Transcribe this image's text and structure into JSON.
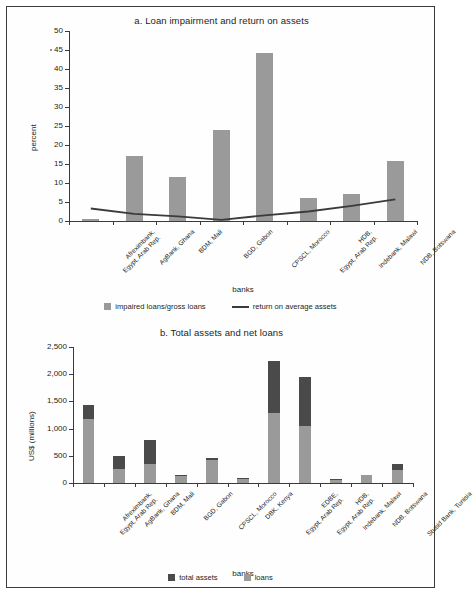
{
  "figure": {
    "border_color": "#3b3b3b",
    "background": "#ffffff"
  },
  "chart_data": [
    {
      "id": "panel-a",
      "type": "bar",
      "title": "a.  Loan impairment and return on assets",
      "xlabel": "banks",
      "ylabel": "percent",
      "ylim": [
        0,
        50
      ],
      "yticks": [
        0,
        5,
        10,
        15,
        20,
        25,
        30,
        35,
        40,
        45,
        50
      ],
      "ytick_labels": [
        "0",
        "5",
        "10",
        "15",
        "20",
        "25",
        "30",
        "35",
        "40",
        "45",
        "50"
      ],
      "grid": false,
      "legend_position": "bottom",
      "categories": [
        [
          "Afreximbank,",
          "Egypt, Arab Rep."
        ],
        [
          "AgBank, Ghana"
        ],
        [
          "BDM, Mali"
        ],
        [
          "BGD, Gabon"
        ],
        [
          "CPSCL, Morocco"
        ],
        [
          "HDB,",
          "Egypt, Arab Rep."
        ],
        [
          "Indebank, Malawi"
        ],
        [
          "NDB, Botswana"
        ]
      ],
      "series": [
        {
          "name": "impaired loans/gross loans",
          "kind": "bar",
          "color": "#9a9a9a",
          "values": [
            0.6,
            17.2,
            11.5,
            23.9,
            44.3,
            6.1,
            7.2,
            15.7
          ]
        },
        {
          "name": "return on average assets",
          "kind": "line",
          "color": "#3b3b3b",
          "values": [
            3.3,
            1.9,
            1.2,
            0.3,
            1.5,
            2.5,
            4.0,
            5.7
          ]
        }
      ]
    },
    {
      "id": "panel-b",
      "type": "bar",
      "title": "b. Total assets and net loans",
      "xlabel": "banks",
      "ylabel": "US$ (millions)",
      "ylim": [
        0,
        2500
      ],
      "yticks": [
        0,
        500,
        1000,
        1500,
        2000,
        2500
      ],
      "ytick_labels": [
        "0",
        "500",
        "1,000",
        "1,500",
        "2,000",
        "2,500"
      ],
      "grid": false,
      "stacked": true,
      "legend_position": "bottom",
      "categories": [
        [
          "Afreximbank,",
          "Egypt, Arab Rep."
        ],
        [
          "AgBank, Ghana"
        ],
        [
          "BDM, Mali"
        ],
        [
          "BGD, Gabon"
        ],
        [
          "CPSCL, Morocco"
        ],
        [
          "DBK, Kenya"
        ],
        [
          "EDBE,",
          "Egypt, Arab Rep."
        ],
        [
          "HDB,",
          "Egypt, Arab Rep."
        ],
        [
          "Indebank, Malawi"
        ],
        [
          "NDB, Botswana"
        ],
        [
          "Stusid Bank, Tunisia"
        ]
      ],
      "series": [
        {
          "name": "loans",
          "kind": "bar",
          "color": "#9a9a9a",
          "values": [
            1180,
            250,
            345,
            120,
            420,
            80,
            1285,
            1055,
            60,
            140,
            235
          ]
        },
        {
          "name": "total assets",
          "kind": "bar",
          "color": "#4a4a4a",
          "values": [
            1430,
            500,
            790,
            145,
            455,
            95,
            2240,
            1940,
            75,
            155,
            345
          ]
        }
      ]
    }
  ],
  "legends": {
    "panel_a": [
      {
        "label": "impaired loans/gross loans",
        "marker": "swatch-light"
      },
      {
        "label": "return on average assets",
        "marker": "line-dark"
      }
    ],
    "panel_b": [
      {
        "label": "total assets",
        "marker": "swatch-dark"
      },
      {
        "label": "loans",
        "marker": "swatch-light"
      }
    ]
  }
}
